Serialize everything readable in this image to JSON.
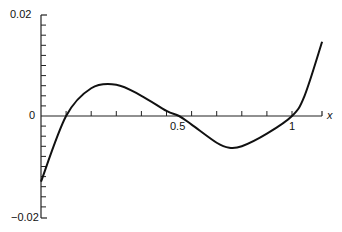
{
  "chart_data": {
    "type": "line",
    "title": "",
    "xlabel": "x",
    "ylabel": "",
    "xlim": [
      0,
      1.12
    ],
    "ylim": [
      -0.02,
      0.02
    ],
    "grid": false,
    "x_ticks": [
      0.5,
      1
    ],
    "x_tick_labels": [
      "0.5",
      "1"
    ],
    "y_tick_labels": [
      "0.02",
      "0",
      "−0.02"
    ],
    "series": [
      {
        "name": "f(x)",
        "x": [
          0,
          0.1,
          0.2,
          0.3,
          0.4,
          0.5,
          0.55,
          0.6,
          0.7,
          0.75,
          0.8,
          0.9,
          1.0,
          1.05,
          1.12
        ],
        "values": [
          -0.013,
          0.0,
          0.0055,
          0.0062,
          0.004,
          0.001,
          0.0,
          -0.0017,
          -0.0053,
          -0.0063,
          -0.006,
          -0.0035,
          0.0,
          0.004,
          0.0147
        ]
      }
    ]
  },
  "labels": {
    "y_top": "0.02",
    "y_zero": "0",
    "y_bottom": "−0.02",
    "x_half": "0.5",
    "x_one": "1",
    "x_axis": "x"
  }
}
